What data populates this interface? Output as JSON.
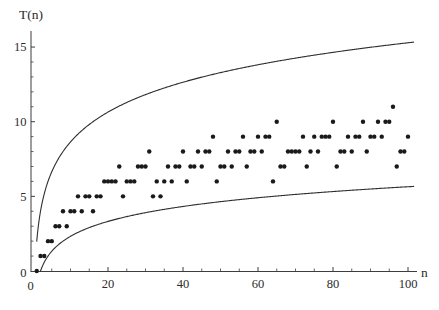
{
  "chart_data": {
    "type": "scatter",
    "title": "",
    "xlabel": "n",
    "ylabel": "T(n)",
    "xlim": [
      0,
      102
    ],
    "ylim": [
      0,
      16
    ],
    "grid": false,
    "legend": null,
    "x_axis": {
      "major_ticks": [
        20,
        40,
        60,
        80,
        100
      ],
      "major_tick_labels": [
        "20",
        "40",
        "60",
        "80",
        "100"
      ],
      "minor_tick_step": 5,
      "origin_label": "0"
    },
    "y_axis": {
      "major_ticks": [
        5,
        10,
        15
      ],
      "major_tick_labels": [
        "5",
        "10",
        "15"
      ],
      "minor_tick_step": 1,
      "origin_label": "0"
    },
    "points": {
      "n": [
        1,
        2,
        3,
        4,
        5,
        6,
        7,
        8,
        9,
        10,
        11,
        12,
        13,
        14,
        15,
        16,
        17,
        18,
        19,
        20,
        21,
        22,
        23,
        24,
        25,
        26,
        27,
        28,
        29,
        30,
        31,
        32,
        33,
        34,
        35,
        36,
        37,
        38,
        39,
        40,
        41,
        42,
        43,
        44,
        45,
        46,
        47,
        48,
        49,
        50,
        51,
        52,
        53,
        54,
        55,
        56,
        57,
        58,
        59,
        60,
        61,
        62,
        63,
        64,
        65,
        66,
        67,
        68,
        69,
        70,
        71,
        72,
        73,
        74,
        75,
        76,
        77,
        78,
        79,
        80,
        81,
        82,
        83,
        84,
        85,
        86,
        87,
        88,
        89,
        90,
        91,
        92,
        93,
        94,
        95,
        96,
        97,
        98,
        99,
        100
      ],
      "T": [
        0,
        1,
        1,
        2,
        2,
        3,
        3,
        4,
        3,
        4,
        4,
        5,
        4,
        5,
        5,
        4,
        5,
        5,
        6,
        6,
        6,
        6,
        7,
        5,
        6,
        6,
        6,
        7,
        7,
        7,
        8,
        5,
        6,
        5,
        6,
        7,
        6,
        7,
        7,
        8,
        6,
        7,
        7,
        8,
        7,
        8,
        8,
        9,
        6,
        7,
        7,
        8,
        7,
        8,
        8,
        9,
        7,
        8,
        8,
        9,
        8,
        9,
        9,
        6,
        10,
        7,
        7,
        8,
        8,
        8,
        8,
        9,
        7,
        8,
        9,
        8,
        9,
        9,
        9,
        10,
        7,
        8,
        8,
        9,
        8,
        9,
        9,
        10,
        8,
        9,
        9,
        10,
        9,
        10,
        10,
        11,
        7,
        8,
        8,
        9
      ]
    },
    "curves": [
      {
        "name": "upper-bound",
        "formula": "2 + 2*log2(n)",
        "offset": 2,
        "scale": 2,
        "domain": [
          1,
          101.5
        ]
      },
      {
        "name": "lower-bound",
        "formula": "log2(n) - 1",
        "offset": -1,
        "scale": 1,
        "domain": [
          2,
          101.5
        ]
      }
    ],
    "colors": {
      "curve": "#2f2f2f",
      "point": "#1a1a1a",
      "axis": "#3d3d3d",
      "text": "#2b2b2b",
      "background": "#ffffff"
    }
  }
}
